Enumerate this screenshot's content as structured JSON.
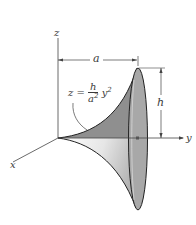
{
  "figure": {
    "axes": {
      "x_label": "x",
      "y_label": "y",
      "z_label": "z"
    },
    "dimensions": {
      "radius_label": "a",
      "height_label": "h"
    },
    "equation": {
      "lhs": "z =",
      "numerator": "h",
      "denominator": "a",
      "denominator_exp": "2",
      "variable": "y",
      "variable_exp": "2"
    },
    "colors": {
      "surface_dark": "#8c8c8c",
      "surface_light": "#d8d8d8",
      "rim_fill": "#a6a6a6",
      "line": "#333333"
    }
  }
}
